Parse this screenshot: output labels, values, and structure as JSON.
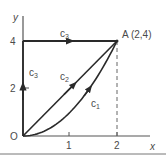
{
  "diagram": {
    "axes": {
      "x_label": "x",
      "y_label": "y",
      "origin_label": "O",
      "x_ticks": [
        "1",
        "2"
      ],
      "y_ticks": [
        "2",
        "4"
      ]
    },
    "point": {
      "label": "A (2,4)",
      "x": 2,
      "y": 4
    },
    "paths": [
      {
        "name": "c",
        "sub": "1",
        "description": "parabola y = x^2 from O to A"
      },
      {
        "name": "c",
        "sub": "2",
        "description": "straight line y = 2x from O to A"
      },
      {
        "name": "c",
        "sub": "3",
        "description": "along y-axis from O to (0,4) then horizontal to A"
      }
    ],
    "colors": {
      "line": "#3a3a3a",
      "text": "#4a4a4a"
    }
  }
}
